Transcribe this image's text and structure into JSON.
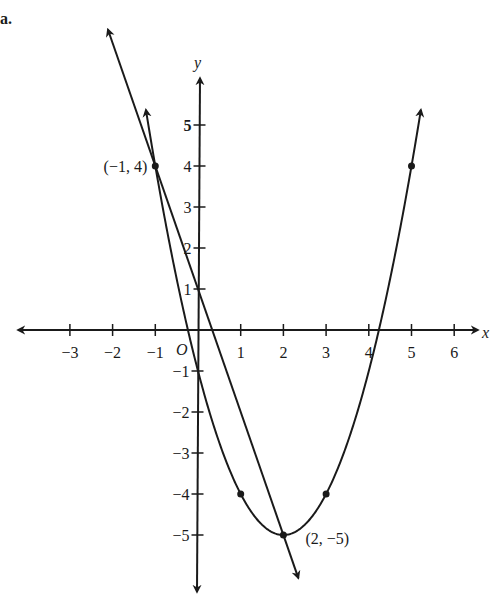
{
  "problem_label": "a.",
  "chart_data": {
    "type": "line",
    "title": "",
    "xlabel": "x",
    "ylabel": "y",
    "origin_label": "O",
    "xlim": [
      -3.5,
      6.4
    ],
    "ylim": [
      -6.2,
      6.2
    ],
    "grid": false,
    "x_ticks": [
      -3,
      -2,
      -1,
      1,
      2,
      3,
      4,
      5,
      6
    ],
    "y_ticks": [
      -5,
      -4,
      -3,
      -2,
      -1,
      1,
      2,
      3,
      4,
      5
    ],
    "series": [
      {
        "name": "parabola",
        "equation": "y = (x - 2)^2 - 5",
        "points": [
          [
            -1,
            4
          ],
          [
            1,
            -4
          ],
          [
            2,
            -5
          ],
          [
            3,
            -4
          ],
          [
            5,
            4
          ]
        ]
      },
      {
        "name": "line",
        "equation": "y = -3x + 1",
        "points": [
          [
            -1,
            4
          ],
          [
            2,
            -5
          ]
        ]
      }
    ],
    "annotations": [
      {
        "text": "(−1, 4)",
        "x": -1,
        "y": 4
      },
      {
        "text": "(2, −5)",
        "x": 2,
        "y": -5
      }
    ]
  }
}
